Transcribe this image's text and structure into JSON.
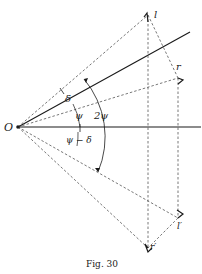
{
  "figure": {
    "caption": "Fig. 30",
    "colors": {
      "ink": "#1a1a1a",
      "dashed": "#555555",
      "background": "#ffffff"
    }
  },
  "points": {
    "origin": {
      "label": "O",
      "x": 18,
      "y": 127
    },
    "l": {
      "label": "l",
      "x": 148,
      "y": 15
    },
    "r": {
      "label": "r",
      "x": 178,
      "y": 78
    },
    "l_prime": {
      "label": "l′",
      "x": 178,
      "y": 218
    },
    "r_prime": {
      "label": "r′",
      "x": 148,
      "y": 248
    }
  },
  "angles": {
    "delta": "δ",
    "psi": "ψ",
    "two_psi": "2ψ",
    "psi_minus_delta": "ψ − δ"
  }
}
